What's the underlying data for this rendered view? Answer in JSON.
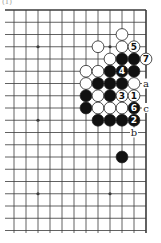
{
  "figure_label": "(1)",
  "board": {
    "size": 19,
    "visible_cols": [
      7,
      18
    ],
    "visible_rows": [
      0,
      18
    ],
    "edges": [
      "top",
      "right"
    ],
    "star_points": [
      [
        9,
        3
      ],
      [
        15,
        3
      ],
      [
        9,
        9
      ],
      [
        15,
        9
      ],
      [
        9,
        15
      ],
      [
        15,
        15
      ]
    ]
  },
  "stones": [
    {
      "color": "white",
      "col": 16,
      "row": 2,
      "label": ""
    },
    {
      "color": "white",
      "col": 14,
      "row": 3,
      "label": ""
    },
    {
      "color": "white",
      "col": 16,
      "row": 3,
      "label": ""
    },
    {
      "color": "white",
      "col": 17,
      "row": 3,
      "label": "5"
    },
    {
      "color": "white",
      "col": 15,
      "row": 4,
      "label": ""
    },
    {
      "color": "black",
      "col": 16,
      "row": 4,
      "label": ""
    },
    {
      "color": "black",
      "col": 17,
      "row": 4,
      "label": ""
    },
    {
      "color": "white",
      "col": 18,
      "row": 4,
      "label": "7"
    },
    {
      "color": "white",
      "col": 13,
      "row": 5,
      "label": ""
    },
    {
      "color": "white",
      "col": 14,
      "row": 5,
      "label": ""
    },
    {
      "color": "black",
      "col": 15,
      "row": 5,
      "label": ""
    },
    {
      "color": "black",
      "col": 16,
      "row": 5,
      "label": "4"
    },
    {
      "color": "black",
      "col": 17,
      "row": 5,
      "label": ""
    },
    {
      "color": "white",
      "col": 13,
      "row": 6,
      "label": ""
    },
    {
      "color": "black",
      "col": 14,
      "row": 6,
      "label": ""
    },
    {
      "color": "black",
      "col": 15,
      "row": 6,
      "label": ""
    },
    {
      "color": "black",
      "col": 16,
      "row": 6,
      "label": ""
    },
    {
      "color": "white",
      "col": 17,
      "row": 6,
      "label": ""
    },
    {
      "color": "black",
      "col": 13,
      "row": 7,
      "label": ""
    },
    {
      "color": "white",
      "col": 14,
      "row": 7,
      "label": ""
    },
    {
      "color": "black",
      "col": 15,
      "row": 7,
      "label": ""
    },
    {
      "color": "white",
      "col": 16,
      "row": 7,
      "label": "3"
    },
    {
      "color": "white",
      "col": 17,
      "row": 7,
      "label": "1"
    },
    {
      "color": "black",
      "col": 13,
      "row": 8,
      "label": ""
    },
    {
      "color": "white",
      "col": 14,
      "row": 8,
      "label": ""
    },
    {
      "color": "white",
      "col": 15,
      "row": 8,
      "label": ""
    },
    {
      "color": "white",
      "col": 16,
      "row": 8,
      "label": ""
    },
    {
      "color": "black",
      "col": 17,
      "row": 8,
      "label": "6"
    },
    {
      "color": "black",
      "col": 14,
      "row": 9,
      "label": ""
    },
    {
      "color": "black",
      "col": 15,
      "row": 9,
      "label": ""
    },
    {
      "color": "black",
      "col": 16,
      "row": 9,
      "label": ""
    },
    {
      "color": "black",
      "col": 17,
      "row": 9,
      "label": "2"
    },
    {
      "color": "black",
      "col": 16,
      "row": 12,
      "label": ""
    }
  ],
  "letter_marks": [
    {
      "text": "a",
      "col": 18,
      "row": 6
    },
    {
      "text": "c",
      "col": 18,
      "row": 8
    },
    {
      "text": "b",
      "col": 17,
      "row": 10
    }
  ],
  "colors": {
    "line": "#3a3a3a",
    "black_stone": "#111111",
    "white_stone": "#ffffff",
    "stone_outline": "#222222"
  }
}
